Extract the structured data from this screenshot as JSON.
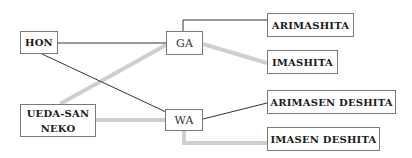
{
  "nodes": {
    "hon": "HON",
    "ueda_line1": "UEDA-SAN",
    "ueda_line2": "NEKO",
    "ga": "GA",
    "wa": "WA",
    "arimashita": "ARIMASHITA",
    "imashita": "IMASHITA",
    "arimasen_deshita": "ARIMASEN DESHITA",
    "imasen_deshita": "IMASEN DESHITA"
  },
  "edges": [
    {
      "from": "HON",
      "to": "GA",
      "style": "thin"
    },
    {
      "from": "HON",
      "to": "WA",
      "style": "thin"
    },
    {
      "from": "UEDA-SAN NEKO",
      "to": "GA",
      "style": "thick-gray"
    },
    {
      "from": "UEDA-SAN NEKO",
      "to": "WA",
      "style": "thick-gray"
    },
    {
      "from": "GA",
      "to": "ARIMASHITA",
      "style": "thin"
    },
    {
      "from": "GA",
      "to": "IMASHITA",
      "style": "thick-gray"
    },
    {
      "from": "WA",
      "to": "ARIMASEN DESHITA",
      "style": "thin"
    },
    {
      "from": "WA",
      "to": "IMASEN DESHITA",
      "style": "thick-gray"
    }
  ],
  "colors": {
    "thin_line": "#333333",
    "thick_line": "#cfcfcf",
    "box_border": "#7a7a7a"
  }
}
